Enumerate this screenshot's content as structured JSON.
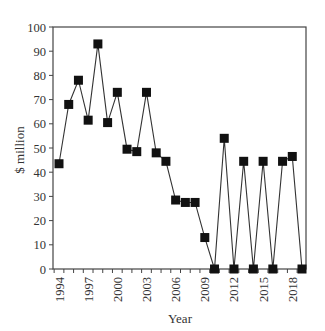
{
  "chart_data": {
    "type": "line",
    "title": "",
    "xlabel": "Year",
    "ylabel": "$ million",
    "ylim": [
      0,
      100
    ],
    "xlim": [
      1993.4,
      2019.4
    ],
    "grid": false,
    "legend": null,
    "marker": "square",
    "line_color": "#333333",
    "marker_color": "#111111",
    "yticks": [
      0,
      10,
      20,
      30,
      40,
      50,
      60,
      70,
      80,
      90,
      100
    ],
    "xtick_labels": [
      "1994",
      "1997",
      "2000",
      "2003",
      "2006",
      "2009",
      "2012",
      "2015",
      "2018"
    ],
    "x": [
      1994,
      1995,
      1996,
      1997,
      1998,
      1999,
      2000,
      2001,
      2002,
      2003,
      2004,
      2005,
      2006,
      2007,
      2008,
      2009,
      2010,
      2011,
      2012,
      2013,
      2014,
      2015,
      2016,
      2017,
      2018,
      2019
    ],
    "series": [
      {
        "name": "$ million",
        "values": [
          43.5,
          68,
          78,
          61.5,
          93,
          60.5,
          73,
          49.5,
          48.5,
          73,
          48,
          44.5,
          28.5,
          27.5,
          27.5,
          13,
          0,
          54,
          0,
          44.5,
          0,
          44.5,
          0,
          44.5,
          46.5,
          0
        ]
      }
    ]
  }
}
